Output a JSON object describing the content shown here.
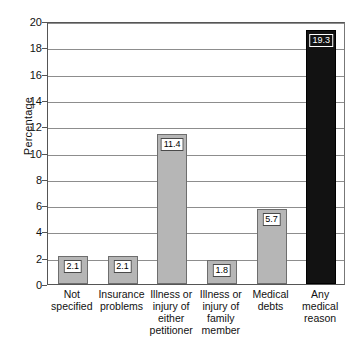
{
  "chart_data": {
    "type": "bar",
    "title": "",
    "xlabel": "",
    "ylabel": "Percentage",
    "ylim": [
      0,
      20
    ],
    "yticks": [
      0,
      2,
      4,
      6,
      8,
      10,
      12,
      14,
      16,
      18,
      20
    ],
    "grid": true,
    "legend": "none",
    "categories": [
      "Not specified",
      "Insurance problems",
      "Illness or injury of either petitioner",
      "Illness or injury of family member",
      "Medical debts",
      "Any medical reason"
    ],
    "category_lines": [
      [
        "Not",
        "specified"
      ],
      [
        "Insurance",
        "problems"
      ],
      [
        "Illness or",
        "injury of",
        "either",
        "petitioner"
      ],
      [
        "Illness or",
        "injury of",
        "family",
        "member"
      ],
      [
        "Medical",
        "debts"
      ],
      [
        "Any",
        "medical",
        "reason"
      ]
    ],
    "values": [
      2.1,
      2.1,
      11.4,
      1.8,
      5.7,
      19.3
    ],
    "value_labels": [
      "2.1",
      "2.1",
      "11.4",
      "1.8",
      "5.7",
      "19.3"
    ],
    "bar_colors": [
      "#b6b6b6",
      "#b6b6b6",
      "#b6b6b6",
      "#b6b6b6",
      "#b6b6b6",
      "#121212"
    ],
    "accent_color": "#b6b6b6",
    "highlight_color": "#121212"
  }
}
